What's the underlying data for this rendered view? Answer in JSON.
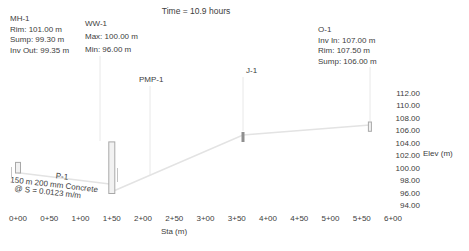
{
  "title": "Time = 10.9 hours",
  "colors": {
    "background": "#ffffff",
    "text": "#3d3d3d",
    "pipe": "#e3e3e3",
    "leader": "#e8e8e8",
    "structure_stroke": "#a8a8a8",
    "structure_fill": "#f2f2f2",
    "junction": "#8f8f8f",
    "callout_tick": "#c4c4c4"
  },
  "annotations": {
    "mh1": {
      "lines": [
        "MH-1",
        "Rim: 101.00 m",
        "Sump: 99.30 m",
        "Inv Out: 99.35 m"
      ]
    },
    "ww1": {
      "lines": [
        "WW-1",
        "Max: 100.00 m",
        "Min: 96.00 m"
      ]
    },
    "o1": {
      "lines": [
        "O-1",
        "Inv In: 107.00 m",
        "Rim: 107.50 m",
        "Sump: 106.00 m"
      ]
    },
    "pmp1": {
      "label": "PMP-1"
    },
    "j1": {
      "label": "J-1"
    }
  },
  "pipe_callout": {
    "name": "P-1",
    "size_line": "150 m 200 mm Concrete",
    "slope_line": "@ S = 0.0123 m/m"
  },
  "axes": {
    "x": {
      "label": "Sta (m)",
      "ticks": [
        {
          "station": 0,
          "label": "0+00"
        },
        {
          "station": 50,
          "label": "0+50"
        },
        {
          "station": 100,
          "label": "1+00"
        },
        {
          "station": 150,
          "label": "1+50"
        },
        {
          "station": 200,
          "label": "2+00"
        },
        {
          "station": 250,
          "label": "2+50"
        },
        {
          "station": 300,
          "label": "3+00"
        },
        {
          "station": 350,
          "label": "3+50"
        },
        {
          "station": 400,
          "label": "4+00"
        },
        {
          "station": 450,
          "label": "4+50"
        },
        {
          "station": 500,
          "label": "5+00"
        },
        {
          "station": 550,
          "label": "5+50"
        },
        {
          "station": 600,
          "label": "6+00"
        }
      ]
    },
    "y": {
      "label": "Elev (m)",
      "ticks": [
        {
          "value": 112,
          "label": "112.00"
        },
        {
          "value": 110,
          "label": "110.00"
        },
        {
          "value": 108,
          "label": "108.00"
        },
        {
          "value": 106,
          "label": "106.00"
        },
        {
          "value": 104,
          "label": "104.00"
        },
        {
          "value": 102,
          "label": "102.00"
        },
        {
          "value": 100,
          "label": "100.00"
        },
        {
          "value": 98,
          "label": "98.00"
        },
        {
          "value": 96,
          "label": "96.00"
        },
        {
          "value": 94,
          "label": "94.00"
        }
      ]
    }
  },
  "chart_data": {
    "type": "line",
    "title": "Time = 10.9 hours",
    "xlabel": "Sta (m)",
    "ylabel": "Elev (m)",
    "xlim": [
      0,
      600
    ],
    "ylim": [
      94,
      112
    ],
    "grid": false,
    "series": [
      {
        "name": "pipe-p1-invert",
        "points": [
          [
            0,
            99.35
          ],
          [
            150,
            97.5
          ]
        ]
      },
      {
        "name": "force-main",
        "points": [
          [
            150,
            96.3
          ],
          [
            360,
            105.4
          ],
          [
            563,
            107.0
          ]
        ]
      }
    ],
    "structures": [
      {
        "name": "MH-1",
        "kind": "manhole",
        "station": 0,
        "top_elev": 101.0,
        "bottom_elev": 99.3,
        "width": 5
      },
      {
        "name": "WW-1",
        "kind": "wet-well",
        "station": 150,
        "top_elev": 104.3,
        "bottom_elev": 96.0,
        "width": 6
      },
      {
        "name": "J-1",
        "kind": "junction",
        "station": 360,
        "top_elev": 105.9,
        "bottom_elev": 104.3,
        "width": 3
      },
      {
        "name": "O-1",
        "kind": "outfall",
        "station": 563,
        "top_elev": 107.5,
        "bottom_elev": 106.0,
        "width": 3
      }
    ]
  }
}
